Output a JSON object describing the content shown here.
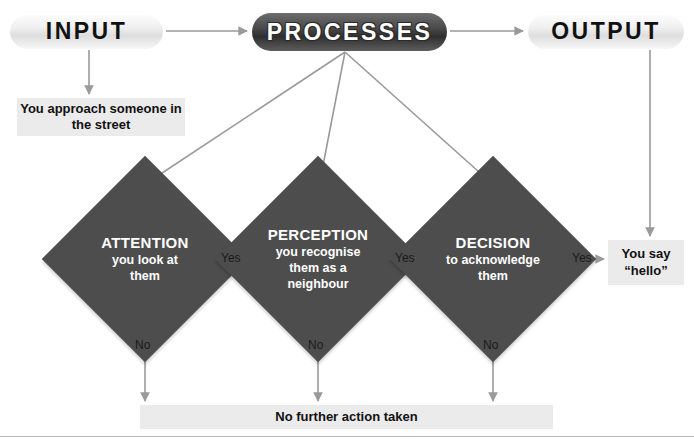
{
  "diagram": {
    "colors": {
      "diamond_fill": "#4d4d4d",
      "note_fill": "#ebebeb",
      "connector": "#9a9a9a",
      "dark_box": "#3a3a3a",
      "text_dark": "#111111",
      "text_light": "#ffffff"
    },
    "stages": [
      {
        "id": "input",
        "label": "INPUT",
        "style": "light"
      },
      {
        "id": "processes",
        "label": "PROCESSES",
        "style": "dark"
      },
      {
        "id": "output",
        "label": "OUTPUT",
        "style": "light"
      }
    ],
    "notes": {
      "input_detail": "You approach someone in the street",
      "say_hello_line1": "You say",
      "say_hello_line2": "“hello”",
      "no_action": "No further action taken"
    },
    "decisions": [
      {
        "id": "attention",
        "title": "ATTENTION",
        "sub_line1": "you look at",
        "sub_line2": "them",
        "sub_line3": "",
        "yes_label": "Yes",
        "no_label": "No"
      },
      {
        "id": "perception",
        "title": "PERCEPTION",
        "sub_line1": "you recognise",
        "sub_line2": "them as a",
        "sub_line3": "neighbour",
        "yes_label": "Yes",
        "no_label": "No"
      },
      {
        "id": "decision",
        "title": "DECISION",
        "sub_line1": "to acknowledge",
        "sub_line2": "them",
        "sub_line3": "",
        "yes_label": "Yes",
        "no_label": "No"
      }
    ]
  }
}
